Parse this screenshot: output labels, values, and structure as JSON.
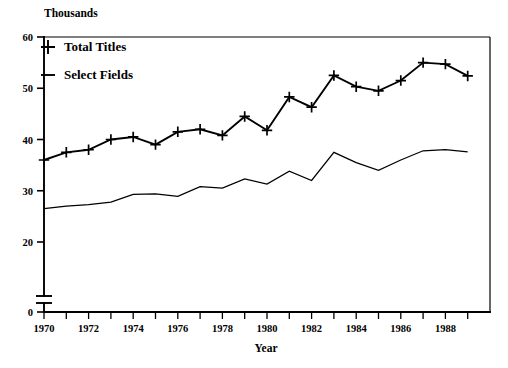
{
  "chart_data": {
    "type": "line",
    "title": "",
    "unit_note": "Thousands",
    "xlabel": "Year",
    "ylabel": "",
    "xlim": [
      1970,
      1989
    ],
    "ylim": [
      0,
      60
    ],
    "y_axis_break": true,
    "y_break_note": "axis break between 0 and ~22",
    "grid": false,
    "legend_position": "top-left inside plot",
    "x": [
      1970,
      1971,
      1972,
      1973,
      1974,
      1975,
      1976,
      1977,
      1978,
      1979,
      1980,
      1981,
      1982,
      1983,
      1984,
      1985,
      1986,
      1987,
      1988,
      1989
    ],
    "xticks": [
      1970,
      1971,
      1972,
      1973,
      1974,
      1975,
      1976,
      1977,
      1978,
      1979,
      1980,
      1981,
      1982,
      1983,
      1984,
      1985,
      1986,
      1987,
      1988,
      1989
    ],
    "xticklabels": [
      "1970",
      "",
      "1972",
      "",
      "1974",
      "",
      "1976",
      "",
      "1978",
      "",
      "1980",
      "",
      "1982",
      "",
      "1984",
      "",
      "1986",
      "",
      "1988",
      ""
    ],
    "yticks": [
      0,
      20,
      30,
      40,
      50,
      60
    ],
    "yticklabels": [
      "0",
      "20",
      "30",
      "40",
      "50",
      "60"
    ],
    "series": [
      {
        "name": "Total Titles",
        "marker": "plus",
        "values": [
          36.0,
          37.5,
          38.0,
          40.0,
          40.5,
          39.0,
          41.5,
          42.0,
          40.8,
          44.5,
          41.8,
          48.3,
          46.3,
          52.5,
          50.3,
          49.5,
          51.5,
          55.0,
          54.7,
          52.4
        ]
      },
      {
        "name": "Select Fields",
        "marker": "none",
        "values": [
          26.5,
          27.0,
          27.3,
          27.8,
          29.3,
          29.4,
          28.9,
          30.8,
          30.5,
          32.3,
          31.3,
          33.8,
          32.0,
          37.5,
          35.5,
          34.0,
          36.0,
          37.8,
          38.0,
          37.6
        ]
      }
    ]
  },
  "labels": {
    "unit_note": "Thousands",
    "xlabel": "Year",
    "legend": [
      {
        "label": "Total Titles"
      },
      {
        "label": "Select Fields"
      }
    ]
  },
  "colors": {
    "ink": "#000000",
    "paper": "#ffffff"
  }
}
